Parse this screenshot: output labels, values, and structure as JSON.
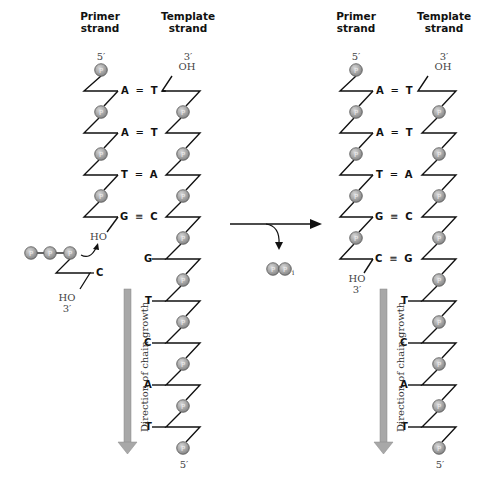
{
  "left": {
    "primer_header": [
      "Primer",
      "strand"
    ],
    "template_header": [
      "Template",
      "strand"
    ],
    "primer_5": "5′",
    "template_3": "3′",
    "template_oh": "OH",
    "primer_ho": "HO",
    "incoming_ho": "HO",
    "incoming_3": "3′",
    "incoming_base": "C",
    "pairs": [
      {
        "primer": "A",
        "bond": "=",
        "template": "T"
      },
      {
        "primer": "A",
        "bond": "=",
        "template": "T"
      },
      {
        "primer": "T",
        "bond": "=",
        "template": "A"
      },
      {
        "primer": "G",
        "bond": "≡",
        "template": "C"
      }
    ],
    "unpaired_template": [
      "G",
      "T",
      "C",
      "A",
      "T"
    ],
    "template_5": "5′",
    "direction_label": "Direction of chain growth"
  },
  "right": {
    "primer_header": [
      "Primer",
      "strand"
    ],
    "template_header": [
      "Template",
      "strand"
    ],
    "primer_5": "5′",
    "template_3": "3′",
    "template_oh": "OH",
    "primer_ho": "HO",
    "primer_3": "3′",
    "pairs": [
      {
        "primer": "A",
        "bond": "=",
        "template": "T"
      },
      {
        "primer": "A",
        "bond": "=",
        "template": "T"
      },
      {
        "primer": "T",
        "bond": "=",
        "template": "A"
      },
      {
        "primer": "G",
        "bond": "≡",
        "template": "C"
      },
      {
        "primer": "C",
        "bond": "≡",
        "template": "G"
      }
    ],
    "unpaired_template": [
      "T",
      "C",
      "A",
      "T"
    ],
    "template_5": "5′",
    "direction_label": "Direction of chain growth"
  },
  "reaction": {
    "byproduct": "PP",
    "byproduct_subscript": "i",
    "phosphate_symbol": "P"
  },
  "colors": {
    "line": "#111111",
    "phosphate_fill": "#9a9a9a",
    "phosphate_stroke": "#555555",
    "arrow_fill": "#a8a8a8",
    "arrow_stroke": "#777777"
  }
}
